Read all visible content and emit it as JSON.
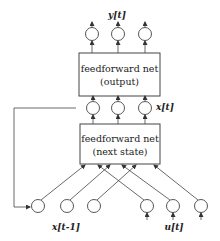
{
  "diagram": {
    "output_label": "y[t]",
    "state_label": "x[t]",
    "prev_state_label": "x[t-1]",
    "input_label": "u[t]",
    "boxes": [
      {
        "id": "output_net",
        "line1": "feedforward net",
        "line2": "(output)"
      },
      {
        "id": "next_state_net",
        "line1": "feedforward net",
        "line2": "(next state)"
      }
    ],
    "layers": {
      "output_nodes": 3,
      "state_nodes": 3,
      "prev_state_nodes": 3,
      "input_nodes": 3
    },
    "colors": {
      "stroke": "#444444",
      "text": "#222222",
      "background": "#ffffff"
    }
  }
}
